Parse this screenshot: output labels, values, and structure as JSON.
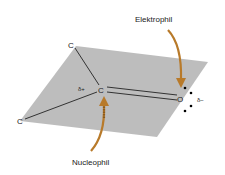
{
  "diagram": {
    "atoms": {
      "carbonyl_carbon": "C",
      "oxygen": "O",
      "substituent_top": "C",
      "substituent_left": "C"
    },
    "charges": {
      "carbon_partial": "δ+",
      "oxygen_partial": "δ−"
    },
    "labels": {
      "electrophile": "Elektrophil",
      "nucleophile": "Nucleophil"
    },
    "colors": {
      "plane": "#b9b9b9",
      "arrow": "#b87a2a",
      "bond": "#222222"
    }
  }
}
